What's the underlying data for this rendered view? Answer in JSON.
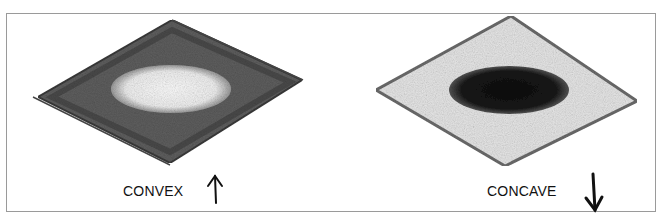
{
  "figure": {
    "panels": [
      {
        "label": "CONVEX",
        "arrow": "up",
        "surface_tone": "dark",
        "center_tone": "light"
      },
      {
        "label": "CONCAVE",
        "arrow": "down",
        "surface_tone": "light",
        "center_tone": "dark"
      }
    ]
  }
}
